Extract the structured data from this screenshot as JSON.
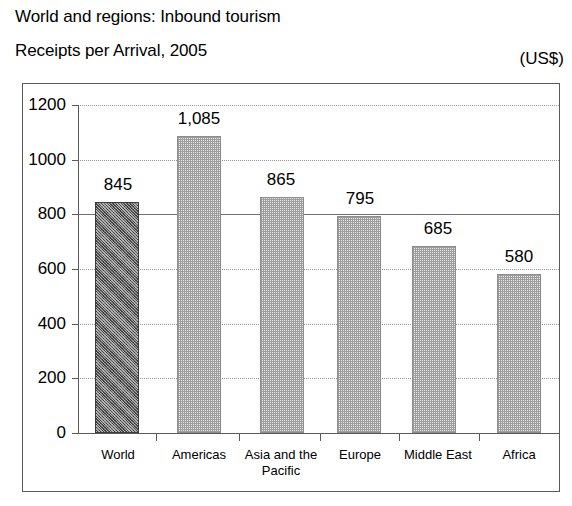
{
  "header": {
    "title_line1": "World and regions: Inbound tourism",
    "title_line2": "Receipts per Arrival, 2005",
    "units": "(US$)"
  },
  "chart_data": {
    "type": "bar",
    "title": "World and regions: Inbound tourism Receipts per Arrival, 2005",
    "subtitle": "Receipts per Arrival, 2005",
    "xlabel": "",
    "ylabel": "",
    "units": "(US$)",
    "categories": [
      "World",
      "Americas",
      "Asia and the Pacific",
      "Europe",
      "Middle East",
      "Africa"
    ],
    "values": [
      845,
      1085,
      865,
      795,
      685,
      580
    ],
    "value_labels": [
      "845",
      "1,085",
      "865",
      "795",
      "685",
      "580"
    ],
    "ylim": [
      0,
      1200
    ],
    "ytick_labels": [
      "0",
      "200",
      "400",
      "600",
      "800",
      "1000",
      "1200"
    ],
    "yticks": [
      0,
      200,
      400,
      600,
      800,
      1000,
      1200
    ],
    "grid": true,
    "grid_style": "dotted",
    "legend": "none",
    "bar_colors": [
      "#5c5c5c",
      "#d8d8d8",
      "#d8d8d8",
      "#d8d8d8",
      "#d8d8d8",
      "#d8d8d8"
    ],
    "highlight_category": "World"
  },
  "category_lines": [
    [
      "World"
    ],
    [
      "Americas"
    ],
    [
      "Asia and the",
      "Pacific"
    ],
    [
      "Europe"
    ],
    [
      "Middle East"
    ],
    [
      "Africa"
    ]
  ]
}
